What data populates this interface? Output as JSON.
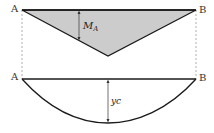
{
  "top_diagram": {
    "title": "Moment diagram",
    "left_label": "A",
    "right_label": "B",
    "dimension_label": "M",
    "dimension_subscript": "A",
    "fill_color": "#cccccc"
  },
  "bottom_diagram": {
    "title": "Deflection curve",
    "left_label": "A",
    "right_label": "B",
    "dimension_label": "yc"
  },
  "colors": {
    "line": "#1a1a1a",
    "dashed": "#999999",
    "fill": "#cccccc"
  }
}
